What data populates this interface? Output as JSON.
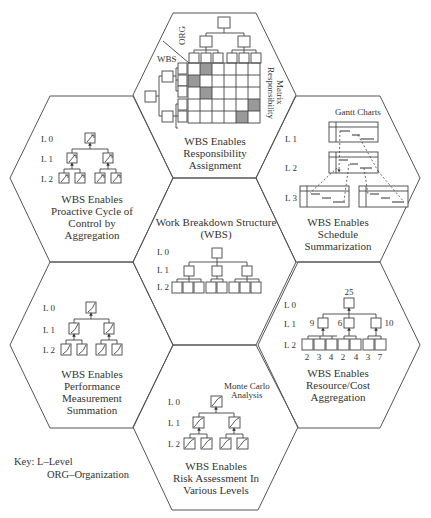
{
  "hexagons": {
    "top": {
      "title_lines": [
        "WBS Enables",
        "Responsibility",
        "Assignment"
      ],
      "labels": {
        "org": "ORG",
        "wbs": "WBS",
        "matrix_lines": [
          "Responsibility",
          "Matrix"
        ]
      },
      "matrix": {
        "rows": 5,
        "cols": 6,
        "shaded_cells": [
          [
            0,
            1
          ],
          [
            1,
            0
          ],
          [
            2,
            1
          ],
          [
            3,
            5
          ],
          [
            4,
            4
          ]
        ]
      }
    },
    "left_top": {
      "title_lines": [
        "WBS Enables",
        "Proactive Cycle of",
        "Control by",
        "Aggregation"
      ],
      "levels": [
        "L 0",
        "L 1",
        "L 2"
      ]
    },
    "center": {
      "title_lines": [
        "Work Breakdown Structure",
        "(WBS)"
      ],
      "levels": [
        "L 0",
        "L 1",
        "L 2"
      ]
    },
    "right_top": {
      "caption": "Gantt Charts",
      "title_lines": [
        "WBS Enables",
        "Schedule",
        "Summarization"
      ],
      "levels": [
        "L 1",
        "L 2",
        "L 3"
      ]
    },
    "left_bottom": {
      "title_lines": [
        "WBS Enables",
        "Performance",
        "Measurement",
        "Summation"
      ],
      "levels": [
        "L 0",
        "L 1",
        "L 2"
      ]
    },
    "right_bottom": {
      "title_lines": [
        "WBS Enables",
        "Resource/Cost",
        "Aggregation"
      ],
      "levels": [
        "L 0",
        "L 1",
        "L 2"
      ],
      "values": {
        "l0": "25",
        "l1": [
          "9",
          "6",
          "10"
        ],
        "l2": [
          "2",
          "3",
          "4",
          "2",
          "4",
          "3",
          "7"
        ]
      }
    },
    "bottom": {
      "caption_lines": [
        "Monte Carlo",
        "Analysis"
      ],
      "title_lines": [
        "WBS Enables",
        "Risk Assessment In",
        "Various Levels"
      ],
      "levels": [
        "L 0",
        "L 1",
        "L 2"
      ]
    }
  },
  "key": {
    "line1": "Key:  L–Level",
    "line2": "ORG–Organization"
  }
}
